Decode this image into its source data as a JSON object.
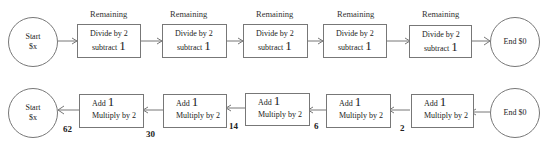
{
  "top_row": {
    "start": {
      "line1": "Start",
      "line2": "$x"
    },
    "end": {
      "label": "End $0"
    },
    "steps": [
      {
        "header": "Remaining",
        "line1": "Divide by 2",
        "line2_text": "subtract",
        "line2_num": "1"
      },
      {
        "header": "Remaining",
        "line1": "Divide by 2",
        "line2_text": "subtract",
        "line2_num": "1"
      },
      {
        "header": "Remaining",
        "line1": "Divide by 2",
        "line2_text": "subtract",
        "line2_num": "1"
      },
      {
        "header": "Remaining",
        "line1": "Divide by 2",
        "line2_text": "subtract",
        "line2_num": "1"
      },
      {
        "header": "Remaining",
        "line1": "Divide by 2",
        "line2_text": "subtract",
        "line2_num": "1"
      }
    ]
  },
  "bottom_row": {
    "start": {
      "line1": "Start",
      "line2": "$x"
    },
    "end": {
      "label": "End $0"
    },
    "steps": [
      {
        "line1_text": "Add",
        "line1_num": "1",
        "line2": "Multiply by 2"
      },
      {
        "line1_text": "Add",
        "line1_num": "1",
        "line2": "Multiply by 2"
      },
      {
        "line1_text": "Add",
        "line1_num": "1",
        "line2": "Multiply by 2"
      },
      {
        "line1_text": "Add",
        "line1_num": "1",
        "line2": "Multiply by 2"
      },
      {
        "line1_text": "Add",
        "line1_num": "1",
        "line2": "Multiply by 2"
      }
    ],
    "values": [
      "62",
      "30",
      "14",
      "6",
      "2"
    ]
  }
}
